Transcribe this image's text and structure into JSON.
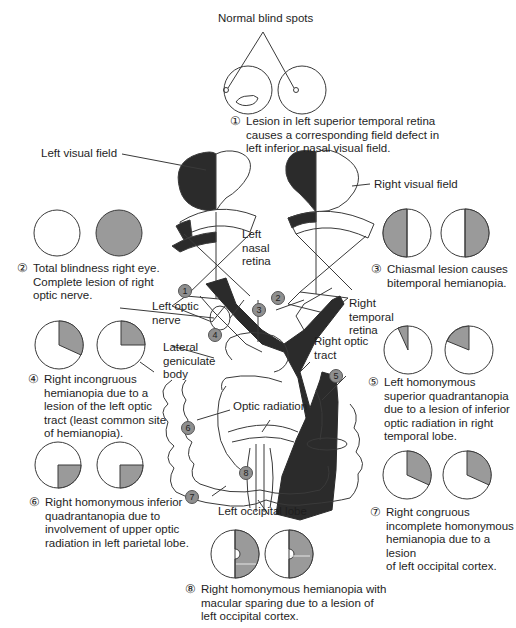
{
  "colors": {
    "dark_fill": "#2b2b2b",
    "defect_gray": "#9a9a9a",
    "badge_gray": "#8f8f8f",
    "line": "#3a3a3a",
    "background": "#ffffff"
  },
  "header": {
    "blind_spots_label": "Normal blind spots"
  },
  "labels": {
    "left_visual_field": "Left visual field",
    "right_visual_field": "Right visual field",
    "left_nasal_retina": [
      "Left",
      "nasal",
      "retina"
    ],
    "right_temporal_retina": [
      "Right",
      "temporal",
      "retina"
    ],
    "left_optic_nerve": [
      "Left optic",
      "nerve"
    ],
    "lateral_geniculate_body": [
      "Lateral",
      "geniculate",
      "body"
    ],
    "right_optic_tract": [
      "Right optic",
      "tract"
    ],
    "optic_radiation": "Optic radiation",
    "left_occipital_lobe": "Left occipital lobe"
  },
  "badges": [
    "1",
    "2",
    "3",
    "4",
    "5",
    "6",
    "7",
    "8"
  ],
  "lesions": [
    {
      "number": "①",
      "lines": [
        "Lesion in left superior temporal retina",
        "causes a corresponding field defect in",
        "left inferior nasal visual field."
      ]
    },
    {
      "number": "②",
      "lines": [
        "Total blindness right eye.",
        "Complete lesion of right",
        "optic nerve."
      ]
    },
    {
      "number": "③",
      "lines": [
        "Chiasmal lesion causes",
        "bitemporal hemianopia."
      ]
    },
    {
      "number": "④",
      "lines": [
        "Right incongruous",
        "hemianopia due to a",
        "lesion of the left optic",
        "tract (least common site",
        "of hemianopia)."
      ]
    },
    {
      "number": "⑤",
      "lines": [
        "Left homonymous",
        "superior quadrantanopia",
        "due to a lesion of inferior",
        "optic radiation in right",
        "temporal lobe."
      ]
    },
    {
      "number": "⑥",
      "lines": [
        "Right homonymous inferior",
        "quadrantanopia due to",
        "involvement of upper optic",
        "radiation in left parietal lobe."
      ]
    },
    {
      "number": "⑦",
      "lines": [
        "Right congruous",
        "incomplete homonymous",
        "hemianopia due to a lesion",
        "of left occipital cortex."
      ]
    },
    {
      "number": "⑧",
      "lines": [
        "Right homonymous hemianopia with",
        "macular sparing due to a lesion of",
        "left occipital cortex."
      ]
    }
  ]
}
